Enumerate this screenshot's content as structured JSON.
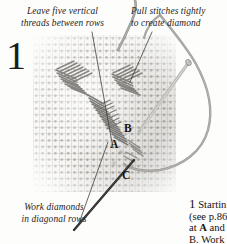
{
  "figure": {
    "step_number": "1",
    "type": "needlework-instruction-photo"
  },
  "captions": {
    "leave_threads": {
      "line1": "Leave five vertical",
      "line2": "threads between rows"
    },
    "pull_stitches": {
      "line1": "Pull stitches tightly",
      "line2": "to create diamond"
    },
    "work_diamonds": {
      "line1": "Work diamonds",
      "line2": "in diagonal rows"
    }
  },
  "point_labels": {
    "a": "A",
    "b": "B",
    "c": "C"
  },
  "body_text": {
    "lead_number": "1",
    "line1": " Startin",
    "line2": "(see p.86",
    "line3_pre": "at ",
    "line3_bold": "A",
    "line3_post": " and",
    "line4": "B. Work"
  },
  "colors": {
    "canvas": "#f6f5f2",
    "mesh_thread": "#78787c",
    "stitch_thread": "#6f6e6b",
    "needle": "#a9a8a4",
    "text": "#1b1b1b",
    "page_background": "#fdfdfc"
  }
}
